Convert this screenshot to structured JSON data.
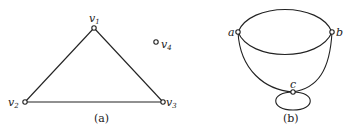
{
  "figure_a": {
    "caption": "(a)",
    "vertices": [
      {
        "id": "v1",
        "label": "v",
        "sub": "1",
        "x": 94,
        "y": 28
      },
      {
        "id": "v2",
        "label": "v",
        "sub": "2",
        "x": 25,
        "y": 102
      },
      {
        "id": "v3",
        "label": "v",
        "sub": "3",
        "x": 163,
        "y": 102
      },
      {
        "id": "v4",
        "label": "v",
        "sub": "4",
        "x": 156,
        "y": 42
      }
    ],
    "edges": [
      [
        "v1",
        "v2"
      ],
      [
        "v1",
        "v3"
      ],
      [
        "v2",
        "v3"
      ]
    ]
  },
  "figure_b": {
    "caption": "(b)",
    "vertices": [
      {
        "id": "a",
        "label": "a",
        "x": 238,
        "y": 32
      },
      {
        "id": "b",
        "label": "b",
        "x": 332,
        "y": 32
      },
      {
        "id": "c",
        "label": "c",
        "x": 293,
        "y": 92
      }
    ],
    "edges": [
      [
        "a",
        "b",
        "upper arc"
      ],
      [
        "a",
        "b",
        "lower arc"
      ],
      [
        "a",
        "c"
      ],
      [
        "b",
        "c"
      ],
      [
        "c",
        "c",
        "loop"
      ]
    ]
  }
}
